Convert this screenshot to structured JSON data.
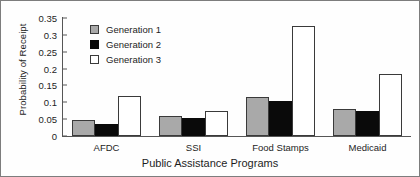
{
  "chart_data": {
    "type": "bar",
    "title": "",
    "xlabel": "Public Assistance Programs",
    "ylabel": "Probability of Receipt",
    "categories": [
      "AFDC",
      "SSI",
      "Food Stamps",
      "Medicaid"
    ],
    "series": [
      {
        "name": "Generation 1",
        "color": "#a9a9a9",
        "values": [
          0.048,
          0.06,
          0.115,
          0.08
        ]
      },
      {
        "name": "Generation 2",
        "color": "#0a0a0a",
        "values": [
          0.035,
          0.052,
          0.105,
          0.075
        ]
      },
      {
        "name": "Generation 3",
        "color": "#ffffff",
        "values": [
          0.12,
          0.075,
          0.325,
          0.185
        ]
      }
    ],
    "ylim": [
      0,
      0.35
    ],
    "yticks": [
      "0",
      "0.05",
      "0.1",
      "0.15",
      "0.2",
      "0.25",
      "0.3",
      "0.35"
    ],
    "ytick_values": [
      0,
      0.05,
      0.1,
      0.15,
      0.2,
      0.25,
      0.3,
      0.35
    ],
    "grid": false,
    "legend_position": "upper-left-inside",
    "legend_entries": [
      "Generation 1",
      "Generation 2",
      "Generation 3"
    ]
  }
}
